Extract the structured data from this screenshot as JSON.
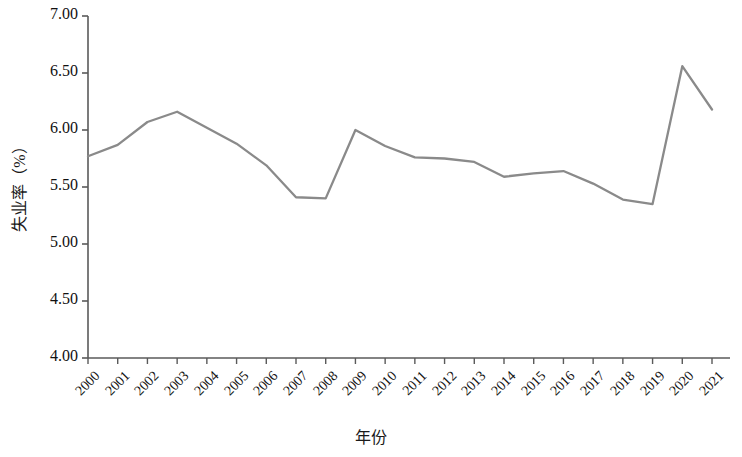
{
  "chart_data": {
    "type": "line",
    "title": "",
    "xlabel": "年份",
    "ylabel": "失业率（%）",
    "categories": [
      "2000",
      "2001",
      "2002",
      "2003",
      "2004",
      "2005",
      "2006",
      "2007",
      "2008",
      "2009",
      "2010",
      "2011",
      "2012",
      "2013",
      "2014",
      "2015",
      "2016",
      "2017",
      "2018",
      "2019",
      "2020",
      "2021"
    ],
    "values": [
      5.77,
      5.87,
      6.07,
      6.16,
      6.02,
      5.88,
      5.69,
      5.41,
      5.4,
      6.0,
      5.86,
      5.76,
      5.75,
      5.72,
      5.59,
      5.62,
      5.64,
      5.53,
      5.39,
      5.35,
      6.56,
      6.18
    ],
    "series": [
      {
        "name": "失业率",
        "color": "#8a8a8a",
        "values": [
          5.77,
          5.87,
          6.07,
          6.16,
          6.02,
          5.88,
          5.69,
          5.41,
          5.4,
          6.0,
          5.86,
          5.76,
          5.75,
          5.72,
          5.59,
          5.62,
          5.64,
          5.53,
          5.39,
          5.35,
          6.56,
          6.18
        ]
      }
    ],
    "ylim": [
      4.0,
      7.0
    ],
    "ytick_labels": [
      "7.00",
      "6.50",
      "6.00",
      "5.50",
      "5.00",
      "4.50",
      "4.00"
    ],
    "ytick_values": [
      7.0,
      6.5,
      6.0,
      5.5,
      5.0,
      4.5,
      4.0
    ],
    "grid": false,
    "legend": "none",
    "line_color": "#8a8a8a",
    "axis_color": "#5a5a5a"
  }
}
